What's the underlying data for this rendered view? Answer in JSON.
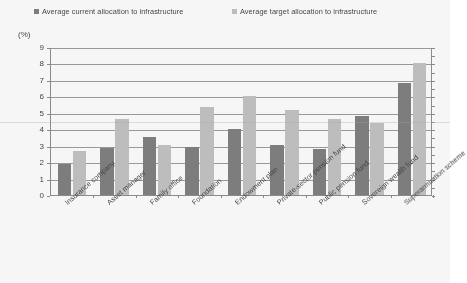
{
  "legend": {
    "items": [
      {
        "label": "Average current allocation to infrastructure",
        "color": "#7d7d7d",
        "key": "current"
      },
      {
        "label": "Average target allocation to infrastructure",
        "color": "#c2c2c2",
        "key": "target"
      }
    ]
  },
  "axis_unit_label": "(%)",
  "chart_data": {
    "type": "bar",
    "title": "",
    "subtitle": "",
    "xlabel": "",
    "ylabel": "(%)",
    "ylim": [
      0,
      9
    ],
    "ytick_step": 1,
    "yticks": [
      "0",
      "1",
      "2",
      "3",
      "4",
      "5",
      "6",
      "7",
      "8",
      "9"
    ],
    "grid": true,
    "legend_position": "top",
    "categories": [
      "Insurance company",
      "Asset manager",
      "Family office",
      "Foundation",
      "Endowment plan",
      "Private-sector pension fund",
      "Public pension fund",
      "Sovereign wealth fund",
      "Superannuation scheme"
    ],
    "series": [
      {
        "name": "Average current allocation to infrastructure",
        "color": "#7d7d7d",
        "values": [
          1.9,
          2.85,
          3.55,
          2.95,
          4.0,
          3.05,
          2.8,
          4.8,
          6.8
        ]
      },
      {
        "name": "Average target allocation to infrastructure",
        "color": "#c2c2c2",
        "values": [
          2.65,
          4.65,
          3.05,
          5.35,
          6.0,
          5.2,
          4.65,
          4.35,
          8.05
        ]
      }
    ]
  }
}
